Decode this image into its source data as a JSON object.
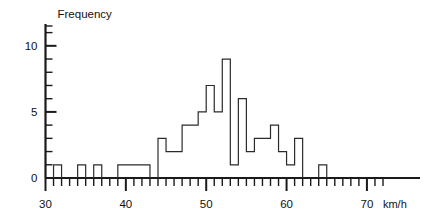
{
  "chart_data": {
    "type": "bar",
    "title": "",
    "subtitle": "",
    "xlabel": "km/h",
    "ylabel": "Frequency",
    "grid": false,
    "legend": null,
    "xlim": [
      30,
      72
    ],
    "ylim": [
      0,
      11.5
    ],
    "x_tick_labels": [
      "30",
      "40",
      "50",
      "60",
      "70"
    ],
    "x_tick_values": [
      30,
      40,
      50,
      60,
      70
    ],
    "x_minor_tick_step": 1,
    "y_tick_labels": [
      "0",
      "5",
      "10"
    ],
    "y_tick_values": [
      0,
      5,
      10
    ],
    "y_minor_tick_step": 1,
    "bin_width": 1,
    "bin_starts": [
      31,
      34,
      36,
      39,
      40,
      41,
      42,
      44,
      45,
      46,
      47,
      48,
      49,
      50,
      51,
      52,
      53,
      54,
      55,
      56,
      57,
      58,
      59,
      60,
      61,
      64
    ],
    "values": [
      1,
      1,
      1,
      1,
      1,
      1,
      1,
      3,
      2,
      2,
      4,
      4,
      5,
      7,
      5,
      9,
      1,
      6,
      2,
      3,
      3,
      4,
      2,
      1,
      3,
      1
    ],
    "categories": [
      "31-32",
      "34-35",
      "36-37",
      "39-40",
      "40-41",
      "41-42",
      "42-43",
      "44-45",
      "45-46",
      "46-47",
      "47-48",
      "48-49",
      "49-50",
      "50-51",
      "51-52",
      "52-53",
      "53-54",
      "54-55",
      "55-56",
      "56-57",
      "57-58",
      "58-59",
      "59-60",
      "60-61",
      "61-62",
      "64-65"
    ],
    "line_color": "#2b2b2b",
    "axis_color": "#1a1a1a",
    "background_color": "#ffffff"
  },
  "labels": {
    "y_axis_title": "Frequency",
    "x_axis_unit": "km/h",
    "y_0": "0",
    "y_5": "5",
    "y_10": "10",
    "x_30": "30",
    "x_40": "40",
    "x_50": "50",
    "x_60": "60",
    "x_70": "70"
  }
}
